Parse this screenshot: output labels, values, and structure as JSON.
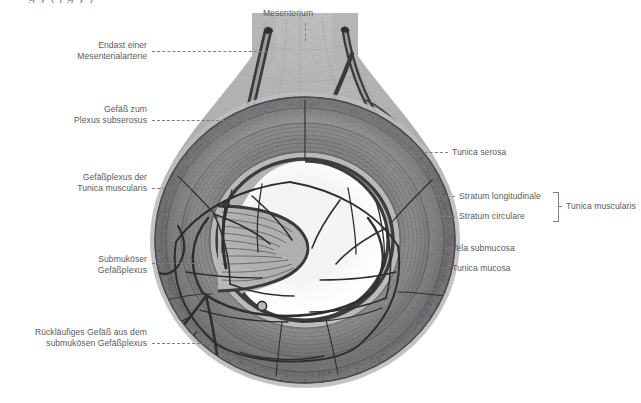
{
  "figure": {
    "cut_off_title": "g  y  ( j      g        y )",
    "background_color": "#ffffff",
    "ink_color": "#59595b"
  },
  "labels": {
    "top": [
      {
        "id": "mesenterium",
        "text": "Mesenterium",
        "align": "center",
        "x": 268,
        "y": 8
      }
    ],
    "left": [
      {
        "id": "endast-mesenterialarterie",
        "line1": "Endast einer",
        "line2": "Mesenterialarterie",
        "x_right": 147,
        "y": 40
      },
      {
        "id": "gefaess-plexus-subserosus",
        "line1": "Gefäß zum",
        "line2": "Plexus subserosus",
        "x_right": 147,
        "y": 104
      },
      {
        "id": "gefaessplexus-tunica-muscularis",
        "line1": "Gefäßplexus der",
        "line2": "Tunica muscularis",
        "x_right": 147,
        "y": 172
      },
      {
        "id": "submukoeser-gefaessplexus",
        "line1": "Submuköser",
        "line2": "Gefäßplexus",
        "x_right": 147,
        "y": 254
      },
      {
        "id": "ruecklaeufiges-gefaess",
        "line1": "Rückläufiges Gefäß aus dem",
        "line2": "submukösen Gefäßplexus",
        "x_right": 147,
        "y": 327
      }
    ],
    "right": [
      {
        "id": "tunica-serosa",
        "text": "Tunica serosa",
        "x_left": 452,
        "y": 152
      },
      {
        "id": "stratum-longitudinale",
        "text": "Stratum longitudinale",
        "x_left": 459,
        "y": 196
      },
      {
        "id": "stratum-circulare",
        "text": "Stratum circulare",
        "x_left": 459,
        "y": 216
      },
      {
        "id": "tela-submucosa",
        "text": "Tela submucosa",
        "x_left": 452,
        "y": 248
      },
      {
        "id": "tunica-mucosa",
        "text": "Tunica mucosa",
        "x_left": 452,
        "y": 268
      }
    ],
    "bracket_group": {
      "id": "tunica-muscularis-group",
      "text": "Tunica muscularis",
      "x_left": 570,
      "y": 206
    }
  },
  "anatomy": {
    "layers": [
      "Tunica serosa",
      "Stratum longitudinale",
      "Stratum circulare",
      "Tela submucosa",
      "Tunica mucosa"
    ],
    "vessel_plexuses": [
      "Plexus subserosus",
      "Gefäßplexus der Tunica muscularis",
      "Submuköser Gefäßplexus"
    ]
  }
}
